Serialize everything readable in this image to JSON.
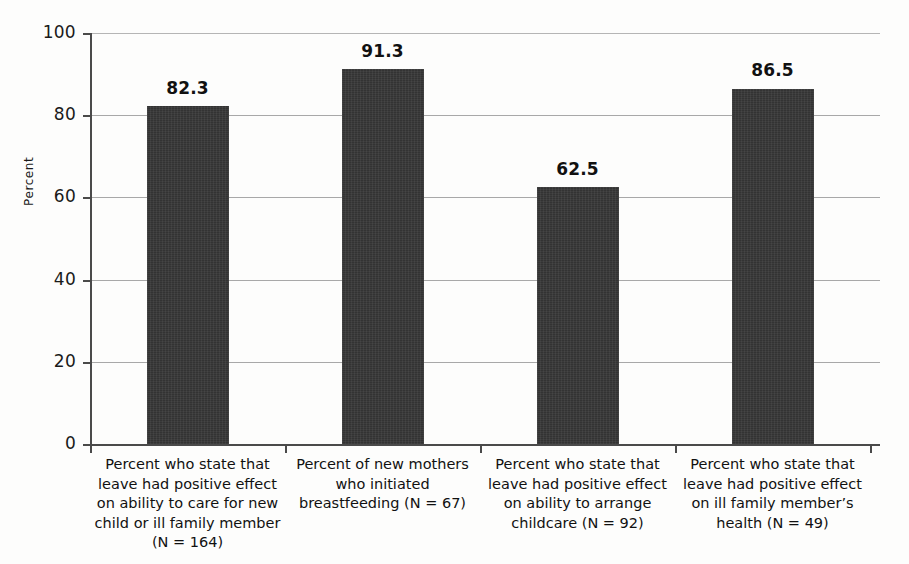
{
  "chart_data": {
    "type": "bar",
    "title": "",
    "subtitle": "",
    "xlabel": "",
    "ylabel": "Percent",
    "ylim": [
      0,
      100
    ],
    "ytick_labels": [
      "100",
      "80",
      "60",
      "40",
      "20",
      "0"
    ],
    "ytick_values": [
      100,
      80,
      60,
      40,
      20,
      0
    ],
    "grid": true,
    "legend": false,
    "categories": [
      "Percent who state that leave had positive effect on ability to care for new child or ill family member (N = 164)",
      "Percent of new mothers who initiated breastfeeding (N = 67)",
      "Percent who state that leave had positive effect on ability to arrange childcare (N = 92)",
      "Percent who state that leave had positive effect on ill family member's health (N = 49)"
    ],
    "category_lines": [
      [
        "Percent who state that",
        "leave had positive effect",
        "on ability to care for new",
        "child or ill family member",
        "(N = 164)"
      ],
      [
        "Percent of new mothers",
        "who initiated",
        "breastfeeding (N = 67)"
      ],
      [
        "Percent who state that",
        "leave had positive effect",
        "on ability to arrange",
        "childcare (N = 92)"
      ],
      [
        "Percent who state that",
        "leave had positive effect",
        "on ill family member’s",
        "health (N = 49)"
      ]
    ],
    "values": [
      82.3,
      91.3,
      62.5,
      86.5
    ],
    "value_labels": [
      "82.3",
      "91.3",
      "62.5",
      "86.5"
    ],
    "sample_sizes": [
      164,
      67,
      92,
      49
    ],
    "bar_color": "#333333",
    "gridline_color": "#a8a8a8",
    "axis_color": "#4a4a4a",
    "background_color": "#fdfdfc"
  }
}
